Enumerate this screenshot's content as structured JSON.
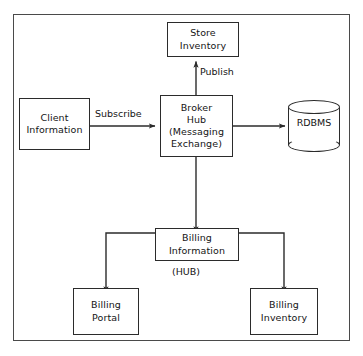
{
  "diagram": {
    "type": "block-flow-diagram",
    "frame_color": "#4a4a4a",
    "node_border_color": "#2b2b2b",
    "background_color": "#ffffff",
    "nodes": [
      {
        "id": "store-inventory",
        "label": "Store\nInventory",
        "shape": "rectangle"
      },
      {
        "id": "client-information",
        "label": "Client\nInformation",
        "shape": "rectangle"
      },
      {
        "id": "broker-hub",
        "label": "Broker\nHub\n(Messaging\nExchange)",
        "shape": "rectangle"
      },
      {
        "id": "rdbms",
        "label": "RDBMS",
        "shape": "cylinder"
      },
      {
        "id": "billing-information",
        "label": "Billing\nInformation",
        "shape": "rectangle"
      },
      {
        "id": "billing-portal",
        "label": "Billing\nPortal",
        "shape": "rectangle"
      },
      {
        "id": "billing-inventory",
        "label": "Billing\nInventory",
        "shape": "rectangle"
      }
    ],
    "edges": [
      {
        "id": "broker-hub-to-store-inventory",
        "from": "broker-hub",
        "to": "store-inventory",
        "label": "Publish",
        "arrow": "single"
      },
      {
        "id": "client-information-to-broker-hub",
        "from": "client-information",
        "to": "broker-hub",
        "label": "Subscribe",
        "arrow": "single"
      },
      {
        "id": "broker-hub-to-rdbms",
        "from": "broker-hub",
        "to": "rdbms",
        "label": "",
        "arrow": "single"
      },
      {
        "id": "broker-hub-to-billing-information",
        "from": "broker-hub",
        "to": "billing-information",
        "label": "",
        "arrow": "single"
      },
      {
        "id": "billing-information-to-billing-portal",
        "from": "billing-information",
        "to": "billing-portal",
        "label": "",
        "arrow": "single"
      },
      {
        "id": "billing-information-to-billing-inventory",
        "from": "billing-information",
        "to": "billing-inventory",
        "label": "",
        "arrow": "single"
      }
    ],
    "annotations": [
      {
        "id": "hub-annotation",
        "text": "(HUB)",
        "attached_to": "billing-information"
      }
    ]
  }
}
